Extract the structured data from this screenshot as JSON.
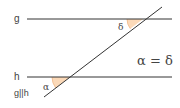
{
  "diagram": {
    "lines": {
      "g": {
        "label": "g",
        "y": 19,
        "x1": 27,
        "x2": 172
      },
      "h": {
        "label": "h",
        "y": 77,
        "x1": 27,
        "x2": 172
      },
      "transversal": {
        "x1": 44,
        "y1": 97,
        "x2": 162,
        "y2": 7
      }
    },
    "angles": {
      "alpha": {
        "symbol": "α",
        "fill": "#fbd9b8"
      },
      "delta": {
        "symbol": "δ",
        "fill": "#fbd9b8"
      }
    },
    "equation": "α = δ",
    "parallel_note": "g||h",
    "colors": {
      "line": "#333333",
      "angle_fill": "#fbd9b8",
      "angle_stroke": "#f0b888",
      "text": "#444444"
    }
  }
}
